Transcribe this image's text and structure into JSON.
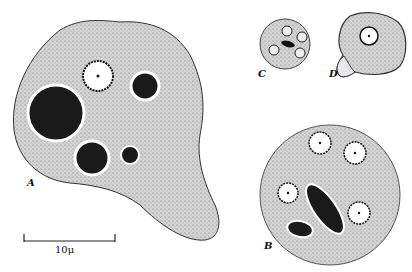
{
  "figure": {
    "panels": [
      {
        "id": "A",
        "label": "A",
        "description": "large amoeboid trophozoite with nucleus and ingested food vacuoles"
      },
      {
        "id": "B",
        "label": "B",
        "description": "mature cyst with four nuclei and chromatoid bodies"
      },
      {
        "id": "C",
        "label": "C",
        "description": "small cyst with four nuclei and chromatoid bar"
      },
      {
        "id": "D",
        "label": "D",
        "description": "precyst with single nucleus and pseudopod"
      }
    ],
    "scale_bar": {
      "label": "10μ",
      "value": 10,
      "unit": "μ"
    },
    "colors": {
      "cytoplasm": "#c9c9c9",
      "outline": "#222222",
      "inclusion": "#1a1a1a",
      "nucleus": "#ffffff"
    }
  }
}
